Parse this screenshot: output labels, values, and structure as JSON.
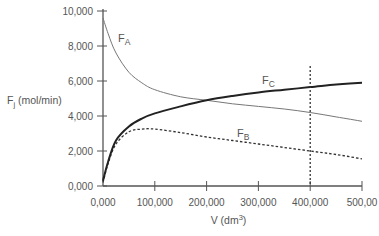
{
  "chart_data": {
    "type": "line",
    "title": "",
    "xlabel": "V (dm3)",
    "xlabel_main": "V (dm",
    "xlabel_sup": "3",
    "xlabel_close": ")",
    "ylabel": "Fj (mol/min)",
    "ylabel_main": "F",
    "ylabel_sub": "j",
    "ylabel_unit": " (mol/min)",
    "xlim": [
      0,
      500000
    ],
    "ylim": [
      0,
      10000
    ],
    "grid": false,
    "legend": "inline labels",
    "x_tick_labels": [
      "0,000",
      "100,000",
      "200,000",
      "300,000",
      "400,000",
      "500,00"
    ],
    "y_tick_labels": [
      "0,000",
      "2,000",
      "4,000",
      "6,000",
      "8,000",
      "10,000"
    ],
    "x": [
      0,
      10000,
      25000,
      50000,
      75000,
      100000,
      150000,
      200000,
      250000,
      300000,
      350000,
      400000,
      450000,
      500000
    ],
    "series": [
      {
        "name": "FA",
        "label_main": "F",
        "label_sub": "A",
        "style": "thin solid",
        "values": [
          9600,
          8700,
          7600,
          6500,
          5900,
          5500,
          5100,
          4900,
          4700,
          4550,
          4400,
          4200,
          3950,
          3700
        ]
      },
      {
        "name": "FB",
        "label_main": "F",
        "label_sub": "B",
        "style": "dashed",
        "values": [
          200,
          1300,
          2400,
          3100,
          3250,
          3250,
          3050,
          2800,
          2600,
          2400,
          2200,
          2000,
          1800,
          1550
        ]
      },
      {
        "name": "FC",
        "label_main": "F",
        "label_sub": "C",
        "style": "thick solid",
        "values": [
          300,
          1400,
          2600,
          3400,
          3850,
          4150,
          4550,
          4900,
          5150,
          5350,
          5500,
          5650,
          5800,
          5900
        ]
      }
    ],
    "annotations": [
      {
        "type": "vertical dotted line",
        "x": 400000
      }
    ]
  }
}
